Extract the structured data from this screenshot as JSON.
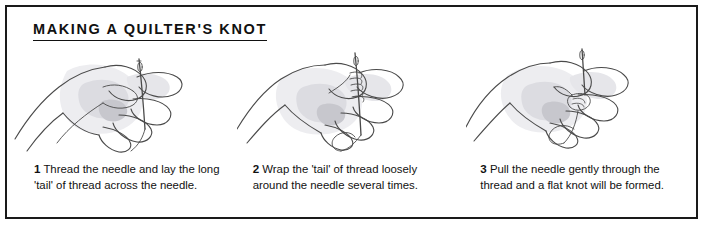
{
  "panel": {
    "title": "MAKING A QUILTER'S KNOT",
    "border_color": "#1a1a1a",
    "background_color": "#ffffff",
    "text_color": "#111111"
  },
  "steps": [
    {
      "number": "1",
      "text": " Thread the needle and lay the long 'tail' of thread across the needle.",
      "illustration_name": "hand-threading-needle-illustration"
    },
    {
      "number": "2",
      "text": " Wrap the 'tail' of thread loosely around the needle several times.",
      "illustration_name": "hand-wrapping-thread-illustration"
    },
    {
      "number": "3",
      "text": " Pull the needle gently through the thread and a flat knot will be formed.",
      "illustration_name": "hand-pulling-needle-illustration"
    }
  ],
  "colors": {
    "line": "#4a4a4a",
    "shade_light": "#e4e4e6",
    "shade_mid": "#c9c9cd",
    "shade_dark": "#a9a9af"
  }
}
